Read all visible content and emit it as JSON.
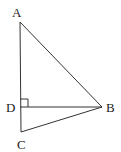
{
  "diagram": {
    "type": "geometry",
    "points": {
      "A": {
        "label": "A",
        "x": 20,
        "y": 22
      },
      "B": {
        "label": "B",
        "x": 102,
        "y": 107
      },
      "C": {
        "label": "C",
        "x": 21,
        "y": 132
      },
      "D": {
        "label": "D",
        "x": 20,
        "y": 107
      }
    },
    "segments": [
      "AC",
      "AB",
      "BC",
      "BD"
    ],
    "right_angle_at": "D",
    "stroke_color": "#333333",
    "label_color": "#222222"
  }
}
